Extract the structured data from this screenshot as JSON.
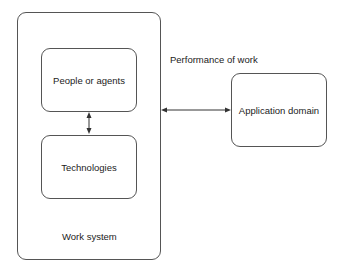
{
  "diagram": {
    "work_system": {
      "label": "Work system"
    },
    "people": {
      "label": "People or agents"
    },
    "technologies": {
      "label": "Technologies"
    },
    "application_domain": {
      "label": "Application domain"
    },
    "connection": {
      "label": "Performance of work"
    },
    "colors": {
      "stroke": "#555555",
      "text": "#222222",
      "background": "#ffffff"
    }
  }
}
